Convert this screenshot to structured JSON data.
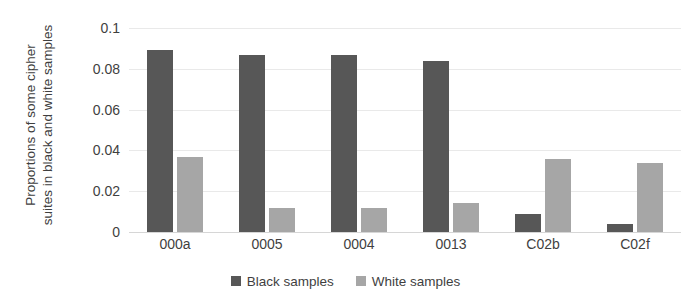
{
  "chart_data": {
    "type": "bar",
    "title": "",
    "xlabel": "",
    "ylabel": "Proportions of some cipher suites in black and white samples",
    "ylabel_lines": [
      "Proportions of some cipher",
      "suites in black and white samples"
    ],
    "categories": [
      "000a",
      "0005",
      "0004",
      "0013",
      "C02b",
      "C02f"
    ],
    "series": [
      {
        "name": "Black samples",
        "color": "#575757",
        "values": [
          0.089,
          0.087,
          0.087,
          0.084,
          0.009,
          0.004
        ]
      },
      {
        "name": "White samples",
        "color": "#a6a6a6",
        "values": [
          0.037,
          0.012,
          0.012,
          0.014,
          0.036,
          0.034
        ]
      }
    ],
    "ylim": [
      0,
      0.1
    ],
    "yticks": [
      0,
      0.02,
      0.04,
      0.06,
      0.08,
      0.1
    ],
    "ytick_labels": [
      "0",
      "0.02",
      "0.04",
      "0.06",
      "0.08",
      "0.1"
    ],
    "grid": true,
    "grid_color": "#e9e9e9",
    "legend_position": "bottom"
  }
}
